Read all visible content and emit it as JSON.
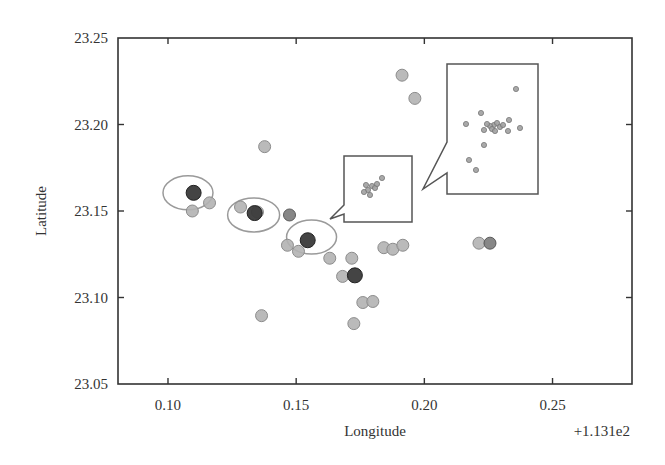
{
  "chart_data": {
    "type": "scatter",
    "title": "",
    "xlabel": "Longitude",
    "ylabel": "Latitude",
    "x_offset_label": "+1.131e2",
    "xlim": [
      0.0805,
      0.281
    ],
    "ylim": [
      23.05,
      23.25
    ],
    "xticks": [
      0.1,
      0.15,
      0.2,
      0.25
    ],
    "xtick_labels": [
      "0.10",
      "0.15",
      "0.20",
      "0.25"
    ],
    "yticks": [
      23.05,
      23.1,
      23.15,
      23.2,
      23.25
    ],
    "ytick_labels": [
      "23.05",
      "23.10",
      "23.15",
      "23.20",
      "23.25"
    ],
    "grid": false,
    "legend": null,
    "colors": {
      "light_point_fill": "#b3b3b3",
      "light_point_stroke": "#8c8c8c",
      "medium_point_fill": "#7a7a7a",
      "dark_point_fill": "#3a3a3a",
      "ellipse_stroke": "#9a9a9a",
      "frame": "#333333",
      "inset_stroke": "#555555"
    },
    "series": [
      {
        "name": "light points",
        "style": "light",
        "points": [
          [
            0.1162,
            23.1547
          ],
          [
            0.1095,
            23.15
          ],
          [
            0.1349,
            23.1494
          ],
          [
            0.1283,
            23.1523
          ],
          [
            0.1466,
            23.1302
          ],
          [
            0.1509,
            23.1267
          ],
          [
            0.1631,
            23.1227
          ],
          [
            0.1717,
            23.1227
          ],
          [
            0.1681,
            23.1122
          ],
          [
            0.176,
            23.0971
          ],
          [
            0.1799,
            23.0977
          ],
          [
            0.1725,
            23.0849
          ],
          [
            0.1842,
            23.1288
          ],
          [
            0.1877,
            23.1279
          ],
          [
            0.1916,
            23.1302
          ],
          [
            0.1913,
            23.2285
          ],
          [
            0.1963,
            23.2151
          ],
          [
            0.1377,
            23.1872
          ],
          [
            0.1365,
            23.0895
          ],
          [
            0.2213,
            23.1314
          ]
        ]
      },
      {
        "name": "medium points",
        "style": "medium",
        "points": [
          [
            0.1474,
            23.1477
          ],
          [
            0.2256,
            23.1314
          ]
        ]
      },
      {
        "name": "dark centroids",
        "style": "dark",
        "points": [
          [
            0.11,
            23.1605
          ],
          [
            0.1338,
            23.1488
          ],
          [
            0.1545,
            23.1331
          ],
          [
            0.1729,
            23.1128
          ]
        ]
      },
      {
        "name": "small cluster (inset 1 content)",
        "style": "tiny",
        "points": [
          [
            0.1826,
            23.1587
          ],
          [
            0.1834,
            23.1593
          ],
          [
            0.1818,
            23.1599
          ],
          [
            0.1842,
            23.1605
          ],
          [
            0.1849,
            23.1663
          ],
          [
            0.181,
            23.157
          ]
        ]
      }
    ],
    "ellipses": [
      {
        "cx": 0.1078,
        "cy": 23.1605,
        "rx_px": 25,
        "ry_px": 17
      },
      {
        "cx": 0.1334,
        "cy": 23.1477,
        "rx_px": 26,
        "ry_px": 17
      },
      {
        "cx": 0.156,
        "cy": 23.1349,
        "rx_px": 25,
        "ry_px": 17
      }
    ],
    "insets": [
      {
        "name": "small-inset",
        "box_px": [
          344,
          156,
          412,
          222
        ],
        "tail_px": [
          [
            344,
            205
          ],
          [
            330,
            219
          ],
          [
            344,
            214
          ]
        ],
        "points_px": [
          [
            368,
            190
          ],
          [
            372,
            186
          ],
          [
            366,
            185
          ],
          [
            375,
            188
          ],
          [
            370,
            195
          ],
          [
            382,
            178
          ],
          [
            364,
            192
          ],
          [
            377,
            184
          ]
        ]
      },
      {
        "name": "large-inset",
        "box_px": [
          447,
          64,
          538,
          194
        ],
        "tail_px": [
          [
            447,
            142
          ],
          [
            423,
            189
          ],
          [
            447,
            173
          ]
        ],
        "points_px": [
          [
            516,
            89
          ],
          [
            481,
            113
          ],
          [
            466,
            124
          ],
          [
            494,
            125
          ],
          [
            490,
            126
          ],
          [
            497,
            123
          ],
          [
            500,
            127
          ],
          [
            492,
            129
          ],
          [
            487,
            124
          ],
          [
            509,
            120
          ],
          [
            520,
            128
          ],
          [
            508,
            131
          ],
          [
            484,
            130
          ],
          [
            484,
            145
          ],
          [
            469,
            160
          ],
          [
            476,
            170
          ],
          [
            503,
            125
          ],
          [
            495,
            131
          ]
        ]
      }
    ]
  }
}
